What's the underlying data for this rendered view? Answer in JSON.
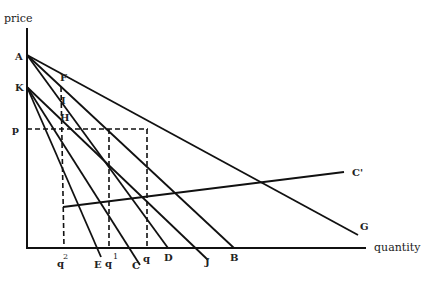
{
  "axes": {
    "y_label": "price",
    "x_label": "quantity"
  },
  "points": {
    "A": "A",
    "K": "K",
    "F": "F",
    "I": "I",
    "H": "H",
    "p": "p",
    "G": "G",
    "C_prime": "C'",
    "B": "B",
    "J": "J",
    "D": "D",
    "C": "C",
    "E": "E"
  },
  "quantity_marks": {
    "q2": {
      "base": "q",
      "sup": "2"
    },
    "q1": {
      "base": "q",
      "sup": "1"
    },
    "q": {
      "base": "q",
      "sup": ""
    }
  },
  "lines": [
    {
      "name": "AG",
      "from": "A",
      "to": "G",
      "via": "F"
    },
    {
      "name": "AB",
      "from": "A",
      "to": "B",
      "via": "I"
    },
    {
      "name": "AD",
      "from": "A",
      "to": "D"
    },
    {
      "name": "KJ",
      "from": "K",
      "to": "J"
    },
    {
      "name": "KC",
      "from": "K",
      "to": "C",
      "via": "H"
    },
    {
      "name": "KE",
      "from": "K",
      "to": "E"
    },
    {
      "name": "CC'",
      "to": "C'"
    }
  ]
}
